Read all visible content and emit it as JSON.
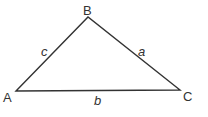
{
  "diagram": {
    "type": "triangle",
    "stroke_color": "#333333",
    "vertices": [
      {
        "name": "A",
        "label": "A",
        "x": 16,
        "y": 91
      },
      {
        "name": "B",
        "label": "B",
        "x": 88,
        "y": 17
      },
      {
        "name": "C",
        "label": "C",
        "x": 180,
        "y": 90
      }
    ],
    "sides": [
      {
        "name": "a",
        "label": "a",
        "from": "B",
        "to": "C"
      },
      {
        "name": "b",
        "label": "b",
        "from": "A",
        "to": "C"
      },
      {
        "name": "c",
        "label": "c",
        "from": "A",
        "to": "B"
      }
    ]
  }
}
